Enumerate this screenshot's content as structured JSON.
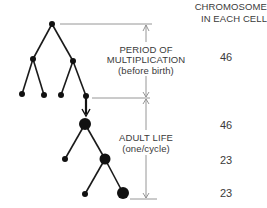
{
  "header": {
    "line1": "CHROMOSOMES",
    "line2": "IN EACH CELL"
  },
  "phases": [
    {
      "lines": [
        "PERIOD OF",
        "MULTIPLICATION",
        "(before birth)"
      ]
    },
    {
      "lines": [
        "ADULT LIFE",
        "(one/cycle)"
      ]
    }
  ],
  "chromosome_counts": [
    "46",
    "46",
    "23",
    "23"
  ],
  "colors": {
    "line": "#8a8a8a",
    "node": "#111111",
    "text": "#3a3a3a"
  }
}
